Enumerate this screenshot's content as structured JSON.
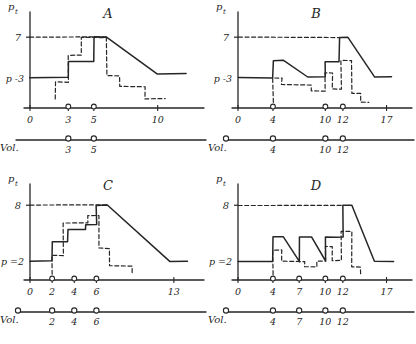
{
  "figure": {
    "style": "hand-drawn line diagram, four panels",
    "panel_count": 4,
    "ink_color": "#262626",
    "paper_color": "#ffffff"
  },
  "common": {
    "y_axis_label": "p",
    "y_axis_sub": "t",
    "x_axis_label": "t",
    "vol_label": "Vol.",
    "solid_series_name": "p_t actual",
    "dashed_series_name": "p_t expected"
  },
  "chart_data": [
    {
      "type": "line",
      "title": "A",
      "xlabel": "t",
      "ylabel": "p",
      "ylabel_sub": "t",
      "p0_label": "p",
      "p0_sub": "0",
      "p0_value": "3",
      "p0_text": "p -3",
      "ceiling_label": "7",
      "ceiling_value": 7,
      "xticks": [
        "0",
        "3",
        "5",
        "10"
      ],
      "xtick_values": [
        0,
        3,
        5,
        10
      ],
      "xlim": [
        0,
        13
      ],
      "ylim": [
        0,
        8.5
      ],
      "grid": false,
      "legend": "none",
      "series": [
        {
          "name": "solid",
          "style": "solid",
          "points": [
            [
              0,
              3
            ],
            [
              3,
              3
            ],
            [
              3,
              4.6
            ],
            [
              5,
              4.6
            ],
            [
              5,
              7
            ],
            [
              6,
              7
            ],
            [
              10,
              3.4
            ],
            [
              12.2,
              3.4
            ]
          ]
        },
        {
          "name": "dashed",
          "style": "dashed",
          "points": [
            [
              2,
              0.9
            ],
            [
              2,
              2.55
            ],
            [
              3,
              2.55
            ],
            [
              3,
              5.2
            ],
            [
              4,
              5.2
            ],
            [
              4,
              7
            ],
            [
              6,
              7
            ],
            [
              6,
              3.2
            ],
            [
              7,
              3.2
            ],
            [
              7,
              2.1
            ],
            [
              9,
              2.1
            ],
            [
              9,
              0.9
            ],
            [
              10.6,
              0.9
            ]
          ]
        },
        {
          "name": "ceiling",
          "style": "dashed",
          "points": [
            [
              0,
              7
            ],
            [
              6,
              7
            ]
          ]
        }
      ],
      "vol_marks": [
        3,
        5
      ],
      "vol_mark_labels": [
        "3",
        "5"
      ],
      "vol_origin_mark": false
    },
    {
      "type": "line",
      "title": "B",
      "xlabel": "t",
      "ylabel": "p",
      "ylabel_sub": "t",
      "p0_label": "p",
      "p0_sub": "0",
      "p0_value": "3",
      "p0_text": "p -3",
      "ceiling_label": "7",
      "ceiling_value": 7,
      "xticks": [
        "0",
        "4",
        "10",
        "12",
        "17"
      ],
      "xtick_values": [
        0,
        4,
        10,
        12,
        17
      ],
      "xlim": [
        0,
        19
      ],
      "ylim": [
        0,
        8.5
      ],
      "grid": false,
      "legend": "none",
      "series": [
        {
          "name": "solid",
          "style": "solid",
          "points": [
            [
              0,
              3
            ],
            [
              4,
              3
            ],
            [
              4,
              4.7
            ],
            [
              5.2,
              4.7
            ],
            [
              8,
              3.1
            ],
            [
              10,
              3.1
            ],
            [
              10,
              4.6
            ],
            [
              11.6,
              4.6
            ],
            [
              11.6,
              7
            ],
            [
              12.6,
              7
            ],
            [
              15.6,
              3.1
            ],
            [
              17.6,
              3.1
            ]
          ]
        },
        {
          "name": "dashed",
          "style": "dashed",
          "points": [
            [
              4,
              0.55
            ],
            [
              4,
              3.0
            ],
            [
              5,
              3.0
            ],
            [
              5,
              2.3
            ],
            [
              8.4,
              2.3
            ],
            [
              8.4,
              1.7
            ],
            [
              10,
              1.7
            ],
            [
              10,
              3.5
            ],
            [
              10.8,
              3.5
            ],
            [
              10.8,
              1.9
            ],
            [
              11.8,
              1.9
            ],
            [
              11.8,
              4.7
            ],
            [
              13,
              4.7
            ],
            [
              13,
              1.45
            ],
            [
              14,
              1.45
            ],
            [
              14,
              0.55
            ],
            [
              15,
              0.55
            ]
          ]
        },
        {
          "name": "ceiling",
          "style": "dashed",
          "points": [
            [
              0,
              7
            ],
            [
              11.6,
              7
            ]
          ]
        }
      ],
      "vol_marks": [
        4,
        10,
        12
      ],
      "vol_mark_labels": [
        "4",
        "10",
        "12"
      ],
      "vol_origin_mark": true
    },
    {
      "type": "line",
      "title": "C",
      "xlabel": "t",
      "ylabel": "p",
      "ylabel_sub": "t",
      "p0_label": "p",
      "p0_sub": "0",
      "p0_value": "2",
      "p0_text": "p =2",
      "ceiling_label": "8",
      "ceiling_value": 8,
      "xticks": [
        "0",
        "2",
        "4",
        "6",
        "13"
      ],
      "xtick_values": [
        0,
        2,
        4,
        6,
        13
      ],
      "xlim": [
        0,
        15
      ],
      "ylim": [
        0,
        9.2
      ],
      "grid": false,
      "legend": "none",
      "series": [
        {
          "name": "solid",
          "style": "solid",
          "points": [
            [
              0,
              2
            ],
            [
              2,
              2
            ],
            [
              2,
              4.1
            ],
            [
              3.4,
              4.1
            ],
            [
              3.4,
              5.4
            ],
            [
              5,
              5.4
            ],
            [
              5,
              5.9
            ],
            [
              6,
              5.9
            ],
            [
              6,
              8
            ],
            [
              7,
              8
            ],
            [
              12.6,
              2
            ],
            [
              14.2,
              2
            ]
          ]
        },
        {
          "name": "dashed",
          "style": "dashed",
          "points": [
            [
              2,
              0.6
            ],
            [
              2,
              2.6
            ],
            [
              3,
              2.6
            ],
            [
              3,
              6.1
            ],
            [
              5.2,
              6.1
            ],
            [
              5.2,
              6.9
            ],
            [
              6.2,
              6.9
            ],
            [
              6.2,
              3.4
            ],
            [
              7.2,
              3.4
            ],
            [
              7.2,
              1.5
            ],
            [
              9.2,
              1.5
            ],
            [
              9.2,
              0.6
            ],
            [
              9.2,
              0.6
            ]
          ]
        },
        {
          "name": "ceiling",
          "style": "dashed",
          "points": [
            [
              0,
              8
            ],
            [
              7,
              8
            ]
          ]
        }
      ],
      "vol_marks": [
        2,
        4,
        6
      ],
      "vol_mark_labels": [
        "2",
        "4",
        "6"
      ],
      "vol_origin_mark": true
    },
    {
      "type": "line",
      "title": "D",
      "xlabel": "t",
      "ylabel": "p",
      "ylabel_sub": "t",
      "p0_label": "p",
      "p0_sub": "0",
      "p0_value": "2",
      "p0_text": "p =2",
      "ceiling_label": "8",
      "ceiling_value": 8,
      "xticks": [
        "0",
        "4",
        "7",
        "10",
        "12",
        "17"
      ],
      "xtick_values": [
        0,
        4,
        7,
        10,
        12,
        17
      ],
      "xlim": [
        0,
        19
      ],
      "ylim": [
        0,
        9.2
      ],
      "grid": false,
      "legend": "none",
      "series": [
        {
          "name": "solid",
          "style": "solid",
          "points": [
            [
              0,
              2
            ],
            [
              4,
              2
            ],
            [
              4,
              4.6
            ],
            [
              5.2,
              4.6
            ],
            [
              7,
              2
            ],
            [
              7,
              2
            ],
            [
              7,
              4.6
            ],
            [
              8.4,
              4.6
            ],
            [
              10,
              2
            ],
            [
              10,
              4.6
            ],
            [
              11.2,
              4.6
            ],
            [
              11.2,
              4.6
            ],
            [
              12,
              4.6
            ],
            [
              12,
              8
            ],
            [
              13,
              8
            ],
            [
              15.6,
              2
            ],
            [
              17.8,
              2
            ]
          ]
        },
        {
          "name": "dashed",
          "style": "dashed",
          "points": [
            [
              4,
              0.6
            ],
            [
              4,
              3.2
            ],
            [
              5,
              3.2
            ],
            [
              5,
              2.0
            ],
            [
              7.6,
              2.0
            ],
            [
              7.6,
              1.4
            ],
            [
              9,
              1.4
            ],
            [
              9,
              2.0
            ],
            [
              10,
              2.0
            ],
            [
              10,
              3.6
            ],
            [
              10.8,
              3.6
            ],
            [
              10.8,
              2.1
            ],
            [
              11.8,
              2.1
            ],
            [
              11.8,
              5.2
            ],
            [
              13,
              5.2
            ],
            [
              13,
              1.4
            ],
            [
              14,
              1.4
            ],
            [
              14,
              0.6
            ]
          ]
        },
        {
          "name": "ceiling",
          "style": "dashed",
          "points": [
            [
              0,
              8
            ],
            [
              12,
              8
            ]
          ]
        }
      ],
      "vol_marks": [
        4,
        7,
        10,
        12
      ],
      "vol_mark_labels": [
        "4",
        "7",
        "10",
        "12"
      ],
      "vol_origin_mark": true
    }
  ]
}
